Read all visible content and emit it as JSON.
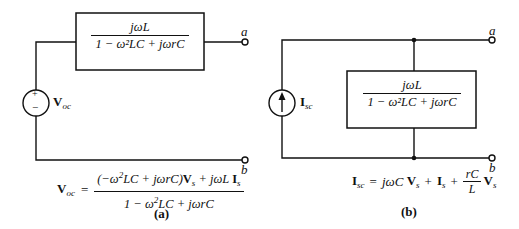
{
  "diagram_a": {
    "box_numerator": "jωL",
    "box_denominator": "1 − ω²LC + jωrC",
    "source_label": "V",
    "source_label_sub": "oc",
    "source_plus": "+",
    "source_minus": "−",
    "terminal_top": "a",
    "terminal_bottom": "b",
    "equation_lhs": "V",
    "equation_lhs_sub": "oc",
    "equation_eq": "=",
    "equation_numerator_parts": [
      "(−ω",
      "2",
      "LC + jωrC)",
      "V",
      "s",
      " + jωL ",
      "I",
      "s"
    ],
    "equation_denominator_parts": [
      "1 − ω",
      "2",
      "LC + jωrC"
    ],
    "caption": "(a)"
  },
  "diagram_b": {
    "box_numerator": "jωL",
    "box_denominator": "1 − ω²LC + jωrC",
    "source_label": "I",
    "source_label_sub": "sc",
    "terminal_top": "a",
    "terminal_bottom": "b",
    "equation_lhs": "I",
    "equation_lhs_sub": "sc",
    "equation_eq": "=",
    "equation_term1": "jωC ",
    "equation_term1_var": "V",
    "equation_term1_sub": "s",
    "equation_plus1": "+",
    "equation_term2_var": "I",
    "equation_term2_sub": "s",
    "equation_plus2": "+",
    "equation_frac_num": "rC",
    "equation_frac_den": "L",
    "equation_term3_var": "V",
    "equation_term3_sub": "s",
    "caption": "(b)"
  }
}
